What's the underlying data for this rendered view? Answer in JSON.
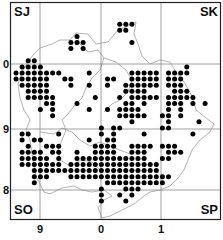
{
  "map": {
    "type": "distribution-dot-map",
    "corner_labels": {
      "top_left": "SJ",
      "top_right": "SK",
      "bottom_left": "SO",
      "bottom_right": "SP"
    },
    "x_axis_labels": [
      "9",
      "0",
      "1"
    ],
    "y_axis_labels": [
      "0",
      "9",
      "8"
    ],
    "dot_color": "#000000",
    "grid_color": "#888888",
    "boundary_color": "#aaaaaa",
    "dots": [
      [
        10,
        4
      ],
      [
        9,
        5
      ],
      [
        10,
        5
      ],
      [
        11,
        5
      ],
      [
        9,
        6
      ],
      [
        11,
        6
      ],
      [
        17,
        2
      ],
      [
        18,
        2
      ],
      [
        19,
        2
      ],
      [
        17,
        3
      ],
      [
        18,
        3
      ],
      [
        19,
        5
      ],
      [
        2,
        8
      ],
      [
        3,
        8
      ],
      [
        1,
        9
      ],
      [
        2,
        9
      ],
      [
        3,
        9
      ],
      [
        4,
        9
      ],
      [
        28,
        9
      ],
      [
        0,
        10
      ],
      [
        1,
        10
      ],
      [
        2,
        10
      ],
      [
        3,
        10
      ],
      [
        4,
        10
      ],
      [
        5,
        10
      ],
      [
        6,
        10
      ],
      [
        7,
        10
      ],
      [
        12,
        10
      ],
      [
        19,
        10
      ],
      [
        20,
        10
      ],
      [
        21,
        10
      ],
      [
        22,
        10
      ],
      [
        23,
        10
      ],
      [
        25,
        10
      ],
      [
        26,
        10
      ],
      [
        27,
        10
      ],
      [
        28,
        10
      ],
      [
        0,
        11
      ],
      [
        1,
        11
      ],
      [
        2,
        11
      ],
      [
        3,
        11
      ],
      [
        4,
        11
      ],
      [
        5,
        11
      ],
      [
        8,
        11
      ],
      [
        9,
        11
      ],
      [
        15,
        11
      ],
      [
        16,
        11
      ],
      [
        19,
        11
      ],
      [
        20,
        11
      ],
      [
        21,
        11
      ],
      [
        22,
        11
      ],
      [
        23,
        11
      ],
      [
        25,
        11
      ],
      [
        26,
        11
      ],
      [
        27,
        11
      ],
      [
        1,
        12
      ],
      [
        2,
        12
      ],
      [
        3,
        12
      ],
      [
        4,
        12
      ],
      [
        5,
        12
      ],
      [
        9,
        12
      ],
      [
        12,
        12
      ],
      [
        15,
        12
      ],
      [
        18,
        12
      ],
      [
        19,
        12
      ],
      [
        20,
        12
      ],
      [
        21,
        12
      ],
      [
        22,
        12
      ],
      [
        23,
        12
      ],
      [
        25,
        12
      ],
      [
        26,
        12
      ],
      [
        27,
        12
      ],
      [
        2,
        13
      ],
      [
        3,
        13
      ],
      [
        4,
        13
      ],
      [
        5,
        13
      ],
      [
        18,
        13
      ],
      [
        19,
        13
      ],
      [
        20,
        13
      ],
      [
        21,
        13
      ],
      [
        26,
        13
      ],
      [
        27,
        13
      ],
      [
        28,
        13
      ],
      [
        2,
        14
      ],
      [
        3,
        14
      ],
      [
        4,
        14
      ],
      [
        5,
        14
      ],
      [
        6,
        14
      ],
      [
        13,
        14
      ],
      [
        17,
        14
      ],
      [
        19,
        14
      ],
      [
        20,
        14
      ],
      [
        21,
        14
      ],
      [
        22,
        14
      ],
      [
        23,
        14
      ],
      [
        25,
        14
      ],
      [
        26,
        14
      ],
      [
        27,
        14
      ],
      [
        28,
        14
      ],
      [
        29,
        14
      ],
      [
        5,
        15
      ],
      [
        6,
        15
      ],
      [
        10,
        15
      ],
      [
        18,
        15
      ],
      [
        19,
        15
      ],
      [
        21,
        15
      ],
      [
        25,
        15
      ],
      [
        26,
        15
      ],
      [
        27,
        15
      ],
      [
        29,
        15
      ],
      [
        31,
        15
      ],
      [
        4,
        16
      ],
      [
        6,
        16
      ],
      [
        12,
        16
      ],
      [
        15,
        16
      ],
      [
        17,
        16
      ],
      [
        18,
        16
      ],
      [
        19,
        16
      ],
      [
        20,
        16
      ],
      [
        25,
        16
      ],
      [
        27,
        16
      ],
      [
        6,
        17
      ],
      [
        17,
        17
      ],
      [
        18,
        17
      ],
      [
        19,
        17
      ],
      [
        20,
        17
      ],
      [
        21,
        17
      ],
      [
        24,
        17
      ],
      [
        25,
        17
      ],
      [
        27,
        17
      ],
      [
        19,
        18
      ],
      [
        25,
        18
      ],
      [
        30,
        18
      ],
      [
        14,
        19
      ],
      [
        16,
        19
      ],
      [
        17,
        19
      ],
      [
        24,
        19
      ],
      [
        25,
        19
      ],
      [
        1,
        20
      ],
      [
        2,
        20
      ],
      [
        7,
        20
      ],
      [
        14,
        20
      ],
      [
        16,
        20
      ],
      [
        21,
        20
      ],
      [
        29,
        20
      ],
      [
        1,
        21
      ],
      [
        3,
        21
      ],
      [
        4,
        21
      ],
      [
        12,
        21
      ],
      [
        15,
        21
      ],
      [
        16,
        21
      ],
      [
        2,
        22
      ],
      [
        5,
        22
      ],
      [
        6,
        22
      ],
      [
        7,
        22
      ],
      [
        13,
        22
      ],
      [
        14,
        22
      ],
      [
        15,
        22
      ],
      [
        16,
        22
      ],
      [
        19,
        22
      ],
      [
        20,
        22
      ],
      [
        21,
        22
      ],
      [
        22,
        22
      ],
      [
        24,
        22
      ],
      [
        25,
        22
      ],
      [
        26,
        22
      ],
      [
        1,
        23
      ],
      [
        2,
        23
      ],
      [
        3,
        23
      ],
      [
        4,
        23
      ],
      [
        6,
        23
      ],
      [
        7,
        23
      ],
      [
        10,
        23
      ],
      [
        13,
        23
      ],
      [
        14,
        23
      ],
      [
        15,
        23
      ],
      [
        16,
        23
      ],
      [
        19,
        23
      ],
      [
        20,
        23
      ],
      [
        21,
        23
      ],
      [
        25,
        23
      ],
      [
        26,
        23
      ],
      [
        27,
        23
      ],
      [
        1,
        24
      ],
      [
        2,
        24
      ],
      [
        3,
        24
      ],
      [
        4,
        24
      ],
      [
        5,
        24
      ],
      [
        7,
        24
      ],
      [
        10,
        24
      ],
      [
        11,
        24
      ],
      [
        12,
        24
      ],
      [
        13,
        24
      ],
      [
        14,
        24
      ],
      [
        15,
        24
      ],
      [
        16,
        24
      ],
      [
        17,
        24
      ],
      [
        18,
        24
      ],
      [
        19,
        24
      ],
      [
        20,
        24
      ],
      [
        21,
        24
      ],
      [
        24,
        24
      ],
      [
        25,
        24
      ],
      [
        1,
        25
      ],
      [
        2,
        25
      ],
      [
        3,
        25
      ],
      [
        4,
        25
      ],
      [
        5,
        25
      ],
      [
        6,
        25
      ],
      [
        7,
        25
      ],
      [
        9,
        25
      ],
      [
        10,
        25
      ],
      [
        11,
        25
      ],
      [
        12,
        25
      ],
      [
        13,
        25
      ],
      [
        14,
        25
      ],
      [
        15,
        25
      ],
      [
        16,
        25
      ],
      [
        17,
        25
      ],
      [
        18,
        25
      ],
      [
        19,
        25
      ],
      [
        20,
        25
      ],
      [
        21,
        25
      ],
      [
        22,
        25
      ],
      [
        23,
        25
      ],
      [
        3,
        26
      ],
      [
        4,
        26
      ],
      [
        5,
        26
      ],
      [
        6,
        26
      ],
      [
        7,
        26
      ],
      [
        8,
        26
      ],
      [
        9,
        26
      ],
      [
        10,
        26
      ],
      [
        11,
        26
      ],
      [
        12,
        26
      ],
      [
        13,
        26
      ],
      [
        14,
        26
      ],
      [
        15,
        26
      ],
      [
        16,
        26
      ],
      [
        17,
        26
      ],
      [
        18,
        26
      ],
      [
        19,
        26
      ],
      [
        20,
        26
      ],
      [
        21,
        26
      ],
      [
        22,
        26
      ],
      [
        23,
        26
      ],
      [
        3,
        27
      ],
      [
        4,
        27
      ],
      [
        5,
        27
      ],
      [
        9,
        27
      ],
      [
        10,
        27
      ],
      [
        11,
        27
      ],
      [
        12,
        27
      ],
      [
        13,
        27
      ],
      [
        14,
        27
      ],
      [
        15,
        27
      ],
      [
        16,
        27
      ],
      [
        17,
        27
      ],
      [
        18,
        27
      ],
      [
        19,
        27
      ],
      [
        20,
        27
      ],
      [
        21,
        27
      ],
      [
        22,
        27
      ],
      [
        23,
        27
      ],
      [
        24,
        27
      ],
      [
        25,
        27
      ],
      [
        3,
        28
      ],
      [
        15,
        28
      ],
      [
        16,
        28
      ],
      [
        17,
        28
      ],
      [
        18,
        28
      ],
      [
        19,
        28
      ],
      [
        20,
        28
      ],
      [
        21,
        28
      ],
      [
        22,
        28
      ],
      [
        23,
        28
      ],
      [
        24,
        28
      ],
      [
        14,
        29
      ],
      [
        18,
        29
      ],
      [
        19,
        29
      ],
      [
        20,
        29
      ],
      [
        14,
        30
      ],
      [
        17,
        30
      ],
      [
        19,
        30
      ],
      [
        14,
        31
      ],
      [
        18,
        31
      ]
    ]
  }
}
